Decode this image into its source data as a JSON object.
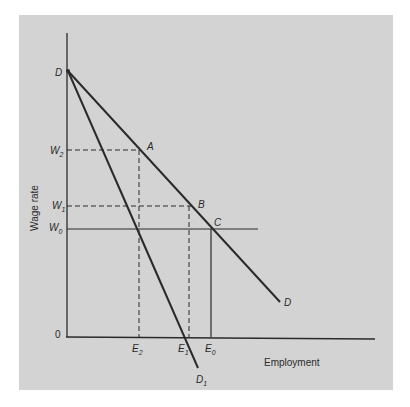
{
  "figure": {
    "background_color": "#d3d3d3",
    "line_color": "#2a2a2a"
  },
  "axes": {
    "ylabel": "Wage rate",
    "xlabel": "Employment",
    "origin_label": "0"
  },
  "points": {
    "D_top": "D",
    "A": "A",
    "B": "B",
    "C": "C"
  },
  "curves": {
    "demand": "D",
    "demand_1": {
      "base": "D",
      "sub": "1"
    }
  },
  "wage_levels": [
    {
      "base": "W",
      "sub": "2"
    },
    {
      "base": "W",
      "sub": "1"
    },
    {
      "base": "W",
      "sub": "0"
    }
  ],
  "employment_levels": [
    {
      "base": "E",
      "sub": "2"
    },
    {
      "base": "E",
      "sub": "1"
    },
    {
      "base": "E",
      "sub": "0"
    }
  ]
}
